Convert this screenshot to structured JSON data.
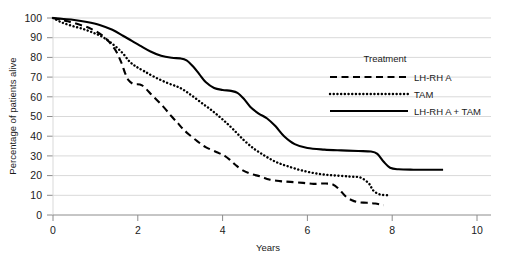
{
  "chart_data": {
    "type": "line",
    "title": "",
    "subtitle": "",
    "xlabel": "Years",
    "ylabel": "Percentage of patients alive",
    "xlim": [
      0,
      10
    ],
    "ylim": [
      0,
      100
    ],
    "xticks": [
      0,
      2,
      4,
      6,
      8,
      10
    ],
    "xtick_labels": [
      "0",
      "2",
      "4",
      "6",
      "8",
      "10"
    ],
    "yticks": [
      0,
      10,
      20,
      30,
      40,
      50,
      60,
      70,
      80,
      90,
      100
    ],
    "ytick_labels": [
      "0",
      "10",
      "20",
      "30",
      "40",
      "50",
      "60",
      "70",
      "80",
      "90",
      "100"
    ],
    "grid": "horizontal",
    "grid_color": "#d9d9d9",
    "axis_color": "#8c8c8c",
    "line_color": "#000000",
    "legend_position": "upper-right",
    "legend_title": "Treatment",
    "series": [
      {
        "name": "LH-RH A",
        "style": "dashed",
        "x": [
          0.0,
          0.15,
          0.35,
          0.6,
          0.9,
          1.2,
          1.45,
          1.6,
          1.7,
          1.78,
          1.9,
          2.1,
          2.35,
          2.6,
          2.8,
          2.95,
          3.05,
          3.2,
          3.4,
          3.6,
          3.85,
          4.05,
          4.2,
          4.3,
          4.45,
          4.65,
          4.9,
          5.1,
          5.35,
          5.6,
          5.9,
          6.15,
          6.4,
          6.6,
          6.75,
          6.9,
          7.05,
          7.2,
          7.4,
          7.6,
          7.8
        ],
        "y": [
          100,
          99.3,
          98.3,
          96.8,
          94.5,
          90.5,
          84.5,
          78.0,
          72.0,
          68.5,
          66.5,
          65.8,
          60.5,
          55.0,
          50.0,
          46.5,
          44.0,
          41.0,
          37.5,
          34.5,
          32.0,
          30.0,
          27.5,
          25.5,
          23.0,
          21.0,
          19.5,
          18.0,
          17.2,
          16.8,
          16.3,
          15.8,
          16.0,
          15.5,
          13.0,
          9.5,
          7.5,
          6.5,
          6.2,
          5.8,
          5.0
        ]
      },
      {
        "name": "TAM",
        "style": "dotted",
        "x": [
          0.0,
          0.2,
          0.45,
          0.7,
          0.95,
          1.2,
          1.45,
          1.65,
          1.8,
          1.95,
          2.15,
          2.4,
          2.7,
          3.0,
          3.25,
          3.5,
          3.75,
          4.0,
          4.25,
          4.5,
          4.75,
          5.0,
          5.25,
          5.5,
          5.8,
          6.1,
          6.4,
          6.7,
          7.0,
          7.25,
          7.45,
          7.55,
          7.7,
          7.9
        ],
        "y": [
          100,
          97.8,
          96.0,
          94.5,
          92.5,
          90.0,
          86.0,
          82.0,
          78.0,
          75.5,
          73.0,
          70.0,
          67.0,
          64.5,
          61.0,
          57.0,
          53.0,
          48.5,
          43.5,
          38.0,
          33.5,
          30.0,
          27.0,
          25.0,
          23.0,
          21.5,
          20.5,
          20.0,
          19.5,
          19.0,
          16.0,
          12.5,
          10.5,
          10.0
        ]
      },
      {
        "name": "LH-RH A + TAM",
        "style": "solid",
        "x": [
          0.0,
          0.25,
          0.5,
          0.8,
          1.1,
          1.4,
          1.65,
          1.85,
          2.05,
          2.3,
          2.55,
          2.8,
          3.0,
          3.15,
          3.3,
          3.45,
          3.6,
          3.8,
          4.0,
          4.2,
          4.35,
          4.5,
          4.65,
          4.85,
          5.05,
          5.25,
          5.45,
          5.7,
          6.0,
          6.4,
          6.8,
          7.2,
          7.5,
          7.65,
          7.8,
          7.95,
          8.15,
          8.5,
          8.9,
          9.2
        ],
        "y": [
          100,
          99.5,
          99.0,
          98.0,
          96.5,
          94.0,
          91.0,
          88.5,
          86.0,
          83.0,
          80.8,
          79.8,
          79.5,
          78.5,
          75.5,
          71.5,
          67.5,
          64.5,
          63.5,
          63.0,
          62.0,
          59.0,
          55.0,
          51.5,
          49.0,
          45.0,
          40.0,
          36.0,
          34.0,
          33.2,
          32.8,
          32.5,
          32.2,
          31.0,
          27.0,
          24.0,
          23.2,
          23.0,
          23.0,
          23.0
        ]
      }
    ]
  }
}
